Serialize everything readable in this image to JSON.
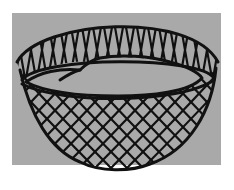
{
  "image": {
    "subject": "woven net basket illustration",
    "colors": {
      "background": "#ffffff",
      "panel": "#a9a9a9",
      "ink": "#111111"
    }
  }
}
